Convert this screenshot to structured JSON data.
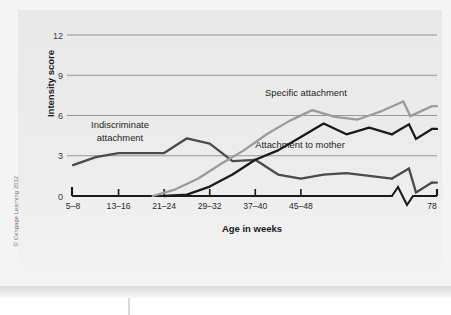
{
  "figure": {
    "copyright": "© Cengage Learning 2012"
  },
  "chart_data": {
    "type": "line",
    "title": "",
    "xlabel": "Age in weeks",
    "ylabel": "Intensity score",
    "categories": [
      "5–8",
      "13–16",
      "21–24",
      "29–32",
      "37–40",
      "45–48",
      "78"
    ],
    "x_tick_labels": [
      "5–8",
      "13–16",
      "21–24",
      "29–32",
      "37–40",
      "45–48",
      "78"
    ],
    "y_tick_labels": [
      "0",
      "3",
      "6",
      "9",
      "12"
    ],
    "y_ticks": [
      0,
      3,
      6,
      9,
      12
    ],
    "ylim": [
      0,
      12
    ],
    "grid": "horizontal",
    "axis_break": true,
    "axis_break_note": "x-axis is broken between 45–48 weeks and 78 weeks",
    "legend": "inline-annotations",
    "series": [
      {
        "name": "Indiscriminate attachment",
        "label": "Indiscriminate attachment",
        "color": "#4a4a4a",
        "label_x": 120,
        "label_y": 128,
        "x": [
          5,
          9,
          13,
          17,
          21,
          25,
          29,
          33,
          37,
          41,
          45,
          49,
          53,
          57,
          61,
          78
        ],
        "values": [
          2.3,
          2.9,
          3.2,
          3.2,
          3.2,
          4.3,
          3.9,
          2.6,
          2.7,
          1.6,
          1.3,
          1.6,
          1.7,
          1.5,
          1.3,
          1.0
        ]
      },
      {
        "name": "Attachment to mother",
        "label": "Attachment to mother",
        "color": "#1a1a1a",
        "label_x": 300,
        "label_y": 148,
        "x": [
          21,
          25,
          29,
          33,
          37,
          41,
          45,
          49,
          53,
          57,
          61,
          78
        ],
        "values": [
          0.0,
          0.1,
          0.7,
          1.6,
          2.7,
          3.4,
          4.4,
          5.4,
          4.6,
          5.1,
          4.6,
          5.0
        ]
      },
      {
        "name": "Specific attachment",
        "label": "Specific attachment",
        "color": "#9b9b9b",
        "label_x": 306,
        "label_y": 96,
        "x": [
          19,
          23,
          27,
          31,
          35,
          39,
          43,
          47,
          51,
          55,
          59,
          78
        ],
        "values": [
          0.0,
          0.5,
          1.3,
          2.4,
          3.4,
          4.6,
          5.6,
          6.4,
          5.9,
          5.7,
          6.3,
          6.7
        ]
      }
    ]
  }
}
